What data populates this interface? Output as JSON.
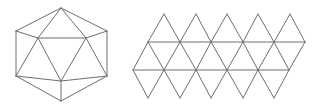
{
  "colors": {
    "stroke": "#6e6e6e",
    "background": "#ffffff"
  },
  "icosahedron": {
    "vertices": {
      "top": [
        61,
        8
      ],
      "upper_left": [
        16,
        31
      ],
      "upper_right": [
        107,
        31
      ],
      "inner_left": [
        38,
        38
      ],
      "inner_right": [
        86,
        38
      ],
      "lower_left": [
        16,
        76
      ],
      "lower_right": [
        107,
        76
      ],
      "inner_bottom": [
        61,
        81
      ],
      "bottom": [
        61,
        101
      ]
    },
    "edges": [
      [
        "top",
        "upper_left"
      ],
      [
        "top",
        "upper_right"
      ],
      [
        "upper_left",
        "lower_left"
      ],
      [
        "upper_right",
        "lower_right"
      ],
      [
        "lower_left",
        "bottom"
      ],
      [
        "lower_right",
        "bottom"
      ],
      [
        "top",
        "inner_left"
      ],
      [
        "top",
        "inner_right"
      ],
      [
        "inner_left",
        "inner_right"
      ],
      [
        "upper_left",
        "inner_left"
      ],
      [
        "upper_right",
        "inner_right"
      ],
      [
        "inner_left",
        "lower_left"
      ],
      [
        "inner_right",
        "lower_right"
      ],
      [
        "inner_left",
        "inner_bottom"
      ],
      [
        "inner_right",
        "inner_bottom"
      ],
      [
        "lower_left",
        "inner_bottom"
      ],
      [
        "lower_right",
        "inner_bottom"
      ],
      [
        "inner_bottom",
        "bottom"
      ]
    ]
  },
  "net": {
    "peaks_y": 14,
    "row1_y": 42,
    "row2_y": 70,
    "bottom_y": 98,
    "peaks_x": [
      164,
      196,
      227,
      258,
      290
    ],
    "row1_x": [
      148,
      180,
      211,
      243,
      274,
      305
    ],
    "row2_x": [
      133,
      164,
      196,
      227,
      258,
      289
    ],
    "bottoms_x": [
      148,
      180,
      211,
      243,
      274
    ],
    "face_count": 20
  }
}
